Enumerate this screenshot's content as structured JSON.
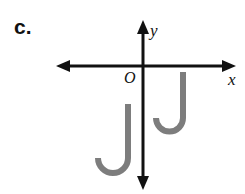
{
  "figure": {
    "part_label": "c.",
    "width": 245,
    "height": 194,
    "background_color": "#ffffff"
  },
  "axes": {
    "color": "#111111",
    "stroke_width": 3,
    "origin": {
      "x": 143,
      "y": 66
    },
    "x_axis": {
      "label": "x",
      "from_x": 56,
      "to_x": 236,
      "y": 66
    },
    "y_axis": {
      "label": "y",
      "from_y": 20,
      "to_y": 190,
      "x": 143
    },
    "origin_label": "O"
  },
  "shapes": {
    "color": "#7d7d7d",
    "stroke_width": 6,
    "items": [
      {
        "name": "j-shape-left",
        "quadrant": "III",
        "stem_x": 128,
        "stem_top_y": 104,
        "hook_bottom_y": 176,
        "hook_left_x": 98
      },
      {
        "name": "j-shape-right",
        "quadrant": "IV",
        "stem_x": 183,
        "stem_top_y": 72,
        "hook_bottom_y": 133,
        "hook_left_x": 156
      }
    ]
  }
}
